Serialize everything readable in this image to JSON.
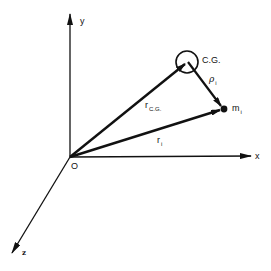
{
  "diagram": {
    "title": "",
    "origin": {
      "label": "O",
      "x": 70,
      "y": 157
    },
    "axes": [
      {
        "name": "y",
        "label": "y",
        "from": [
          70,
          157
        ],
        "to": [
          70,
          14
        ]
      },
      {
        "name": "x",
        "label": "x",
        "from": [
          70,
          157
        ],
        "to": [
          251,
          156
        ]
      },
      {
        "name": "z",
        "label": "z",
        "from": [
          70,
          157
        ],
        "to": [
          12,
          253
        ]
      }
    ],
    "points": {
      "cg": {
        "label": "C.G.",
        "x": 187,
        "y": 62,
        "marker": "circle",
        "radius": 11
      },
      "mi": {
        "label": "m",
        "subscript": "i",
        "x": 224,
        "y": 109,
        "marker": "dot"
      }
    },
    "vectors": [
      {
        "name": "r_cg",
        "label": "r",
        "subscript": "C.G.",
        "from": "origin",
        "to": "cg"
      },
      {
        "name": "r_i",
        "label": "r",
        "subscript": "i",
        "from": "origin",
        "to": "mi"
      },
      {
        "name": "rho_i",
        "label": "ρ",
        "subscript": "i",
        "from": "cg",
        "to": "mi"
      }
    ],
    "colors": {
      "ink": "#111111",
      "background": "#ffffff"
    }
  }
}
